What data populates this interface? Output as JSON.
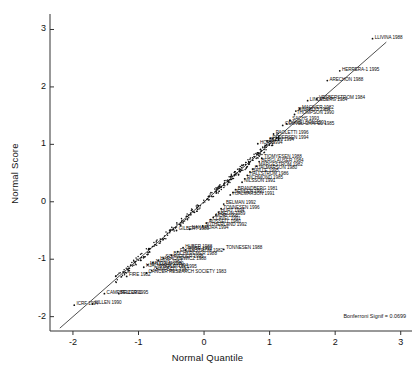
{
  "chart_data": {
    "type": "scatter",
    "title": "",
    "xlabel": "Normal Quantile",
    "ylabel": "Normal Score",
    "xlim": [
      -2.35,
      3.05
    ],
    "ylim": [
      -2.25,
      3.2
    ],
    "xticks": [
      -2,
      -1,
      0,
      1,
      2,
      3
    ],
    "yticks": [
      -2,
      -1,
      0,
      1,
      2,
      3
    ],
    "grid": false,
    "legend": null,
    "annotation": "Bonferroni Signif = 0.0699",
    "reference_line": {
      "slope": 1.0,
      "intercept": 0.0,
      "x_from": -2.2,
      "x_to": 2.78
    },
    "point_marker": "dot",
    "labels_position": "right-of-point",
    "points": [
      {
        "label": "LLIVINA 1988",
        "x": 2.57,
        "y": 2.84
      },
      {
        "label": "HERRERA-1 1995",
        "x": 2.07,
        "y": 2.28
      },
      {
        "label": "ARECHON 1988",
        "x": 1.88,
        "y": 2.11
      },
      {
        "label": "VESBERSTROM 1984",
        "x": 1.72,
        "y": 1.79
      },
      {
        "label": "LINDEBERG 1984",
        "x": 1.58,
        "y": 1.76
      },
      {
        "label": "MACIVER 1982",
        "x": 1.46,
        "y": 1.62
      },
      {
        "label": "RINARDO 1984",
        "x": 1.4,
        "y": 1.58
      },
      {
        "label": "THOMPSON 1990",
        "x": 1.38,
        "y": 1.52
      },
      {
        "label": "SACHS 1993",
        "x": 1.31,
        "y": 1.42
      },
      {
        "label": "DANIELSON 1991",
        "x": 1.26,
        "y": 1.36
      },
      {
        "label": "COUVEL-CHAPEL 1985",
        "x": 1.2,
        "y": 1.33
      },
      {
        "label": "PAOLETTI 1996",
        "x": 1.06,
        "y": 1.18
      },
      {
        "label": "PEDERSEN 1994",
        "x": 1.01,
        "y": 1.1
      },
      {
        "label": "BOLIN 1994",
        "x": 0.96,
        "y": 1.06
      },
      {
        "label": "HORI 1994",
        "x": 0.82,
        "y": 1.01
      },
      {
        "label": "TIOMYESEN 1988",
        "x": 0.88,
        "y": 0.76
      },
      {
        "label": "BERGLAUSER 1984",
        "x": 0.84,
        "y": 0.7
      },
      {
        "label": "MARGESTROM 1982",
        "x": 0.8,
        "y": 0.62
      },
      {
        "label": "HJALMARSON 1980",
        "x": 0.74,
        "y": 0.57
      },
      {
        "label": "BAILLE 1995",
        "x": 0.7,
        "y": 0.52
      },
      {
        "label": "HALLSTROM 1986",
        "x": 0.66,
        "y": 0.46
      },
      {
        "label": "RICHMOND 1985",
        "x": 0.62,
        "y": 0.4
      },
      {
        "label": "NILSSON 1991",
        "x": 0.58,
        "y": 0.34
      },
      {
        "label": "BRANDBERG 1981",
        "x": 0.48,
        "y": 0.21
      },
      {
        "label": "JENSEN 1991",
        "x": 0.44,
        "y": 0.16
      },
      {
        "label": "HJALMARSON 1991",
        "x": 0.4,
        "y": 0.12
      },
      {
        "label": "BELMAN 1992",
        "x": 0.3,
        "y": -0.04
      },
      {
        "label": "TONNESEN 1996",
        "x": 0.26,
        "y": -0.12
      },
      {
        "label": "HURT 1994",
        "x": 0.22,
        "y": -0.18
      },
      {
        "label": "ABELIN 1989",
        "x": 0.18,
        "y": -0.23
      },
      {
        "label": "MORI 1992",
        "x": 0.14,
        "y": -0.27
      },
      {
        "label": "CLAVEL 1991",
        "x": 0.1,
        "y": -0.31
      },
      {
        "label": "RUSSELL 1980",
        "x": 0.04,
        "y": -0.37
      },
      {
        "label": "SUTHERLAND 1992",
        "x": -0.02,
        "y": -0.42
      },
      {
        "label": "GILBERT 1989",
        "x": -0.42,
        "y": -0.5
      },
      {
        "label": "NAKAMURA 1994",
        "x": -0.22,
        "y": -0.48
      },
      {
        "label": "TONNESEN 1988",
        "x": 0.3,
        "y": -0.83
      },
      {
        "label": "HUBER 1988",
        "x": -0.32,
        "y": -0.8
      },
      {
        "label": "ROSE 1992",
        "x": -0.28,
        "y": -0.84
      },
      {
        "label": "FAGERSTROM 1982",
        "x": -0.4,
        "y": -0.87
      },
      {
        "label": "BUCHKREMER 1988",
        "x": -0.5,
        "y": -0.93
      },
      {
        "label": "SCHNEIDER 1995",
        "x": -0.62,
        "y": -0.98
      },
      {
        "label": "HARACKIEWICZ 1988",
        "x": -0.7,
        "y": -1.02
      },
      {
        "label": "JARVIS 1982",
        "x": -0.78,
        "y": -1.06
      },
      {
        "label": "MALCOLM 1980",
        "x": -0.86,
        "y": -1.1
      },
      {
        "label": "HJALMARSON 1994",
        "x": -0.92,
        "y": -1.14
      },
      {
        "label": "STAPLETON 1995",
        "x": -0.72,
        "y": -1.16
      },
      {
        "label": "CAMPBELL 1987",
        "x": -0.8,
        "y": -1.2
      },
      {
        "label": "CANCER RESEARCH SOCIETY 1983",
        "x": -0.88,
        "y": -1.24
      },
      {
        "label": "FIRE 1982",
        "x": -1.18,
        "y": -1.3
      },
      {
        "label": "CAMPBELL 1991",
        "x": -1.52,
        "y": -1.6
      },
      {
        "label": "PFIZER 1995",
        "x": -1.3,
        "y": -1.6
      },
      {
        "label": "KILLEN 1990",
        "x": -1.7,
        "y": -1.78
      },
      {
        "label": "ICRF 1994",
        "x": -1.98,
        "y": -1.8
      }
    ],
    "unlabeled_cluster_note": "dense overlapping point cloud along the reference line between quantiles -1.0 and 1.0"
  },
  "axes": {
    "x_title": "Normal Quantile",
    "y_title": "Normal Score",
    "x_tick_labels": [
      "-2",
      "-1",
      "0",
      "1",
      "2",
      "3"
    ],
    "y_tick_labels": [
      "-2",
      "-1",
      "0",
      "1",
      "2",
      "3"
    ]
  },
  "annotations": {
    "bonferroni": "Bonferroni Signif = 0.0699"
  },
  "colors": {
    "background": "#ffffff",
    "axis": "#333333",
    "point": "#111111",
    "line": "#222222",
    "text": "#111111"
  }
}
